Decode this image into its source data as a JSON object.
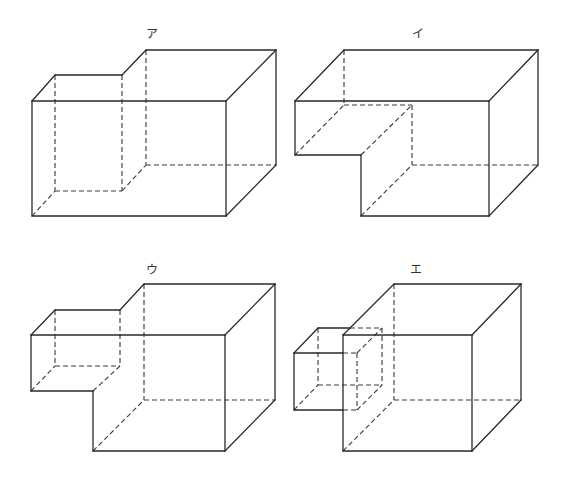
{
  "figures": [
    {
      "label": "ア",
      "label_pos": [
        152,
        24
      ],
      "solid": [
        [
          32,
          101,
          226,
          101
        ],
        [
          226,
          101,
          226,
          216
        ],
        [
          226,
          216,
          32,
          216
        ],
        [
          32,
          216,
          32,
          101
        ],
        [
          32,
          101,
          55,
          75
        ],
        [
          55,
          75,
          122,
          75
        ],
        [
          122,
          75,
          146,
          50
        ],
        [
          146,
          50,
          276,
          50
        ],
        [
          226,
          101,
          276,
          50
        ],
        [
          276,
          50,
          276,
          165
        ],
        [
          226,
          216,
          276,
          165
        ]
      ],
      "dashed": [
        [
          55,
          75,
          55,
          191
        ],
        [
          55,
          191,
          122,
          191
        ],
        [
          122,
          75,
          122,
          191
        ],
        [
          32,
          216,
          55,
          191
        ],
        [
          146,
          50,
          146,
          165
        ],
        [
          122,
          191,
          146,
          165
        ],
        [
          146,
          165,
          276,
          165
        ]
      ]
    },
    {
      "label": "イ",
      "label_pos": [
        418,
        24
      ],
      "solid": [
        [
          295,
          101,
          489,
          101
        ],
        [
          295,
          101,
          295,
          155
        ],
        [
          295,
          155,
          361,
          155
        ],
        [
          361,
          155,
          361,
          216
        ],
        [
          361,
          216,
          489,
          216
        ],
        [
          489,
          101,
          489,
          216
        ],
        [
          295,
          101,
          344,
          50
        ],
        [
          344,
          50,
          538,
          50
        ],
        [
          489,
          101,
          538,
          50
        ],
        [
          538,
          50,
          538,
          165
        ],
        [
          489,
          216,
          538,
          165
        ]
      ],
      "dashed": [
        [
          344,
          50,
          344,
          105
        ],
        [
          344,
          105,
          412,
          105
        ],
        [
          295,
          155,
          344,
          105
        ],
        [
          412,
          105,
          412,
          165
        ],
        [
          361,
          155,
          412,
          105
        ],
        [
          361,
          216,
          412,
          165
        ],
        [
          412,
          165,
          538,
          165
        ]
      ]
    },
    {
      "label": "ウ",
      "label_pos": [
        152,
        260
      ],
      "solid": [
        [
          31,
          335,
          225,
          335
        ],
        [
          31,
          335,
          31,
          391
        ],
        [
          31,
          391,
          93,
          391
        ],
        [
          93,
          391,
          93,
          451
        ],
        [
          93,
          451,
          225,
          451
        ],
        [
          225,
          335,
          225,
          451
        ],
        [
          31,
          335,
          55,
          310
        ],
        [
          55,
          310,
          120,
          310
        ],
        [
          120,
          310,
          144,
          284
        ],
        [
          144,
          284,
          275,
          284
        ],
        [
          225,
          335,
          275,
          284
        ],
        [
          275,
          284,
          275,
          400
        ],
        [
          225,
          451,
          275,
          400
        ]
      ],
      "dashed": [
        [
          55,
          310,
          55,
          366
        ],
        [
          55,
          366,
          120,
          366
        ],
        [
          120,
          310,
          120,
          366
        ],
        [
          31,
          391,
          55,
          366
        ],
        [
          93,
          391,
          120,
          366
        ],
        [
          144,
          284,
          144,
          400
        ],
        [
          144,
          400,
          275,
          400
        ],
        [
          93,
          451,
          144,
          400
        ]
      ]
    },
    {
      "label": "エ",
      "label_pos": [
        416,
        260
      ],
      "solid": [
        [
          343,
          335,
          472,
          335
        ],
        [
          472,
          335,
          472,
          451
        ],
        [
          472,
          451,
          343,
          451
        ],
        [
          343,
          451,
          343,
          335
        ],
        [
          343,
          335,
          394,
          284
        ],
        [
          394,
          284,
          521,
          284
        ],
        [
          472,
          335,
          521,
          284
        ],
        [
          521,
          284,
          521,
          400
        ],
        [
          472,
          451,
          521,
          400
        ],
        [
          294,
          353,
          294,
          410
        ],
        [
          294,
          410,
          343,
          410
        ],
        [
          294,
          353,
          343,
          353
        ],
        [
          294,
          353,
          318,
          328
        ],
        [
          318,
          328,
          350,
          328
        ]
      ],
      "dashed": [
        [
          394,
          284,
          394,
          400
        ],
        [
          394,
          400,
          521,
          400
        ],
        [
          343,
          451,
          394,
          400
        ],
        [
          343,
          353,
          357,
          353
        ],
        [
          357,
          353,
          357,
          410
        ],
        [
          343,
          410,
          357,
          410
        ],
        [
          350,
          328,
          382,
          328
        ],
        [
          382,
          328,
          382,
          385
        ],
        [
          318,
          328,
          318,
          385
        ],
        [
          318,
          385,
          382,
          385
        ],
        [
          294,
          410,
          318,
          385
        ],
        [
          357,
          353,
          382,
          328
        ],
        [
          357,
          410,
          382,
          385
        ]
      ]
    }
  ]
}
